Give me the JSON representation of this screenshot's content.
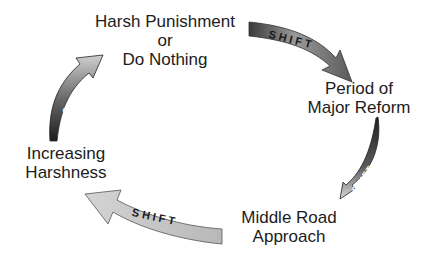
{
  "diagram": {
    "type": "cycle",
    "nodes": [
      {
        "id": "harsh",
        "lines": [
          "Harsh Punishment",
          "or",
          "Do Nothing"
        ]
      },
      {
        "id": "reform",
        "lines": [
          "Period of",
          "Major Reform"
        ]
      },
      {
        "id": "middle",
        "lines": [
          "Middle Road",
          "Approach"
        ]
      },
      {
        "id": "increasing",
        "lines": [
          "Increasing",
          "Harshness"
        ]
      }
    ],
    "arrows": [
      {
        "from": "harsh",
        "to": "reform",
        "label": "SHIFT"
      },
      {
        "from": "reform",
        "to": "middle",
        "label": "SHIFT"
      },
      {
        "from": "middle",
        "to": "increasing",
        "label": "SHIFT"
      },
      {
        "from": "increasing",
        "to": "harsh",
        "label": "SHIFT"
      }
    ],
    "colors": {
      "text": "#1c1c1c",
      "arrow_dark": "#3a3a3a",
      "arrow_mid": "#8a8a8a",
      "arrow_light": "#d8d8d8",
      "background": "#ffffff"
    }
  }
}
